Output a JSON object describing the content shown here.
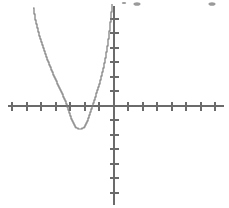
{
  "figure": {
    "title": "",
    "background_color": "#ffffff",
    "axis_color": "#6b6b6b",
    "curve_color": "#7a7a7a",
    "width": 229,
    "height": 208
  },
  "chart_data": {
    "type": "line",
    "title": "",
    "xlabel": "",
    "ylabel": "",
    "grid": false,
    "legend": "none",
    "origin_px": {
      "x": 114,
      "y": 106
    },
    "pixels_per_unit": {
      "x": 14.5,
      "y": 14.5
    },
    "xlim": [
      -7.9,
      7.9
    ],
    "ylim": [
      -7.1,
      6.8
    ],
    "x_axis": {
      "axis_from_px": 8,
      "axis_to_px": 224,
      "tick_length_px": 9,
      "tick_values": [
        -7,
        -6,
        -5,
        -4,
        -3,
        -2,
        -1,
        1,
        2,
        3,
        4,
        5,
        6,
        7
      ],
      "tick_px": [
        12,
        27,
        41,
        56,
        70,
        85,
        99,
        128,
        143,
        157,
        172,
        186,
        201,
        215
      ],
      "tick_labels": []
    },
    "y_axis": {
      "axis_from_px": 6,
      "axis_to_px": 205,
      "tick_length_px": 9,
      "tick_values": [
        6,
        5,
        4,
        3,
        2,
        1,
        -1,
        -2,
        -3,
        -4,
        -5,
        -6
      ],
      "tick_px": [
        19,
        33,
        48,
        62,
        77,
        91,
        120,
        135,
        149,
        164,
        178,
        193
      ],
      "tick_labels": []
    },
    "curve": {
      "name": "parabola",
      "equation": "y = a(x - h)^2 + k",
      "vertex": {
        "x": -5.2,
        "y": -1.5
      },
      "x_intercepts": [
        -6.75,
        -3.6
      ],
      "opens": "up",
      "drawn_x_domain": [
        -5.6,
        6.8
      ],
      "x": [
        -5.6,
        -5.4,
        -5.2,
        -5.0,
        -4.8,
        -4.6,
        -4.4,
        -4.2,
        -4.0,
        -3.8,
        -3.6,
        -3.4,
        -3.2,
        -3.0,
        -2.8,
        -2.6,
        -2.4,
        -2.2,
        -2.0,
        -1.8,
        -1.6,
        -1.4,
        -1.2,
        -1.0,
        -0.8,
        -0.6
      ],
      "y": [
        6.7,
        5.6,
        4.6,
        3.7,
        2.9,
        2.1,
        1.4,
        0.8,
        0.3,
        -0.2,
        -0.6,
        -0.9,
        -1.15,
        -1.35,
        -1.47,
        -1.52,
        -1.5,
        -1.4,
        -1.2,
        -0.95,
        -0.6,
        -0.2,
        0.3,
        0.9,
        1.6,
        2.4
      ],
      "note": "Plot is a stair-stepped/pixelated plot of a single quadratic function; left branch enters at the top of the frame and right branch exits at the top of the frame just left of the y-axis."
    },
    "series": [
      {
        "name": "parabola",
        "points_px": [
          [
            33,
            8
          ],
          [
            34,
            14
          ],
          [
            35,
            20
          ],
          [
            36,
            24
          ],
          [
            37,
            28
          ],
          [
            38,
            32
          ],
          [
            39,
            36
          ],
          [
            40,
            39
          ],
          [
            41,
            42
          ],
          [
            42,
            45
          ],
          [
            43,
            48
          ],
          [
            44,
            51
          ],
          [
            45,
            54
          ],
          [
            46,
            57
          ],
          [
            47,
            60
          ],
          [
            48,
            62
          ],
          [
            49,
            65
          ],
          [
            50,
            67
          ],
          [
            51,
            70
          ],
          [
            52,
            72
          ],
          [
            53,
            75
          ],
          [
            54,
            77
          ],
          [
            55,
            79
          ],
          [
            56,
            81
          ],
          [
            57,
            84
          ],
          [
            58,
            86
          ],
          [
            59,
            88
          ],
          [
            60,
            90
          ],
          [
            61,
            92
          ],
          [
            62,
            94
          ],
          [
            63,
            97
          ],
          [
            64,
            99
          ],
          [
            65,
            101
          ],
          [
            66,
            104
          ],
          [
            67,
            107
          ],
          [
            68,
            110
          ],
          [
            69,
            113
          ],
          [
            70,
            116
          ],
          [
            71,
            119
          ],
          [
            72,
            121
          ],
          [
            73,
            123
          ],
          [
            74,
            125
          ],
          [
            75,
            127
          ],
          [
            76,
            128
          ],
          [
            78,
            129
          ],
          [
            80,
            129
          ],
          [
            82,
            128
          ],
          [
            84,
            127
          ],
          [
            85,
            125
          ],
          [
            86,
            123
          ],
          [
            87,
            121
          ],
          [
            88,
            118
          ],
          [
            89,
            115
          ],
          [
            90,
            112
          ],
          [
            91,
            109
          ],
          [
            92,
            106
          ],
          [
            93,
            103
          ],
          [
            94,
            100
          ],
          [
            95,
            97
          ],
          [
            96,
            93
          ],
          [
            97,
            90
          ],
          [
            98,
            87
          ],
          [
            99,
            84
          ],
          [
            100,
            80
          ],
          [
            101,
            76
          ],
          [
            102,
            72
          ],
          [
            103,
            68
          ],
          [
            104,
            63
          ],
          [
            105,
            58
          ],
          [
            106,
            52
          ],
          [
            107,
            46
          ],
          [
            108,
            39
          ],
          [
            109,
            31
          ],
          [
            110,
            22
          ],
          [
            111,
            12
          ],
          [
            112,
            4
          ]
        ]
      }
    ]
  },
  "artifacts": {
    "specks": [
      {
        "x": 137,
        "y": 4,
        "r": 2.2
      },
      {
        "x": 212,
        "y": 4,
        "r": 2.2
      },
      {
        "x": 124,
        "y": 3,
        "r": 1.4
      }
    ]
  }
}
